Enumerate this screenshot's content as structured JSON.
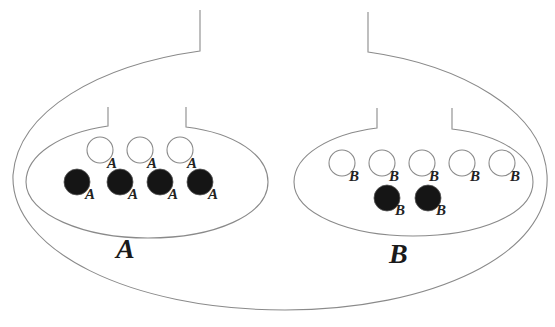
{
  "diagram": {
    "title": "",
    "compartments": [
      {
        "id": "A",
        "label": "A",
        "open_particles": {
          "count": 3,
          "sublabel": "A"
        },
        "filled_particles": {
          "count": 4,
          "sublabel": "A"
        }
      },
      {
        "id": "B",
        "label": "B",
        "open_particles": {
          "count": 5,
          "sublabel": "B"
        },
        "filled_particles": {
          "count": 2,
          "sublabel": "B"
        }
      }
    ],
    "colors": {
      "outline": "#8a8a8a",
      "filled_particle": "#151515",
      "open_particle": "#ffffff",
      "text": "#1a1a1a"
    }
  },
  "labels": {
    "A_open": [
      "A",
      "A",
      "A"
    ],
    "A_filled": [
      "A",
      "A",
      "A",
      "A"
    ],
    "B_open": [
      "B",
      "B",
      "B",
      "B",
      "B"
    ],
    "B_filled": [
      "B",
      "B"
    ],
    "A_big": "A",
    "B_big": "B"
  }
}
